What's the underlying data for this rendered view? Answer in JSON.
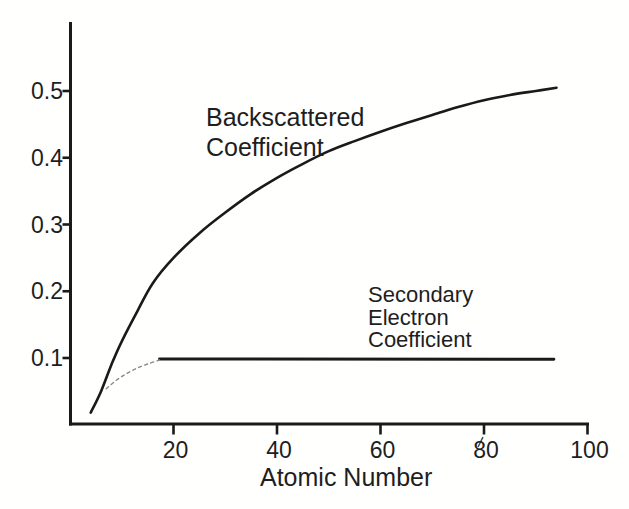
{
  "figure": {
    "background": "#ffffff",
    "ink_color": "#1e1e1e",
    "curve_color": "#1a1a1a",
    "dashed_color": "#8a8a8a"
  },
  "chart_data": {
    "type": "line",
    "title": "",
    "xlabel": "Atomic Number",
    "ylabel": "",
    "xlim": [
      0,
      100
    ],
    "ylim": [
      0,
      0.6
    ],
    "x_ticks": [
      20,
      40,
      60,
      80,
      100
    ],
    "y_ticks": [
      0.1,
      0.2,
      0.3,
      0.4,
      0.5
    ],
    "x_tick_labels": [
      "20",
      "40",
      "60",
      "80",
      "100"
    ],
    "y_tick_labels": [
      "0.1",
      "0.2",
      "0.3",
      "0.4",
      "0.5"
    ],
    "grid": false,
    "legend": "none (inline text annotations)",
    "series": [
      {
        "name": "Backscattered Coefficient",
        "style": "solid",
        "points": [
          [
            4,
            0.018
          ],
          [
            6,
            0.05
          ],
          [
            8,
            0.09
          ],
          [
            10,
            0.125
          ],
          [
            13,
            0.17
          ],
          [
            16,
            0.212
          ],
          [
            20,
            0.25
          ],
          [
            25,
            0.287
          ],
          [
            30,
            0.318
          ],
          [
            35,
            0.346
          ],
          [
            40,
            0.37
          ],
          [
            45,
            0.391
          ],
          [
            50,
            0.41
          ],
          [
            55,
            0.425
          ],
          [
            60,
            0.439
          ],
          [
            65,
            0.452
          ],
          [
            70,
            0.464
          ],
          [
            75,
            0.476
          ],
          [
            80,
            0.486
          ],
          [
            85,
            0.494
          ],
          [
            90,
            0.5
          ],
          [
            94,
            0.505
          ]
        ]
      },
      {
        "name": "Secondary Electron Coefficient (saturated plateau)",
        "style": "solid",
        "points": [
          [
            17.3,
            0.0985
          ],
          [
            93.5,
            0.098
          ]
        ]
      },
      {
        "name": "Secondary Electron Coefficient (low-Z rise, dashed)",
        "style": "dashed",
        "points": [
          [
            7,
            0.054
          ],
          [
            9,
            0.067
          ],
          [
            11,
            0.077
          ],
          [
            13,
            0.085
          ],
          [
            15,
            0.091
          ],
          [
            17.3,
            0.097
          ]
        ]
      }
    ],
    "annotations": [
      {
        "id": "backscattered",
        "lines": [
          "Backscattered",
          "Coefficient"
        ],
        "anchor_Z": 26,
        "anchor_value": 0.45
      },
      {
        "id": "secondary",
        "lines": [
          "Secondary",
          "Electron",
          "Coefficient"
        ],
        "anchor_Z": 58,
        "anchor_value": 0.14
      }
    ]
  }
}
